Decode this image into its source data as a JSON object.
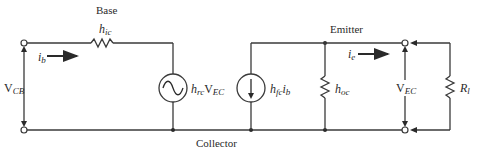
{
  "diagram": {
    "node_labels": {
      "base": "Base",
      "emitter": "Emitter",
      "collector": "Collector"
    },
    "components": {
      "input_resistor": {
        "symbol": "h",
        "subscript": "ic"
      },
      "voltage_source": {
        "symbol": "h",
        "subscript": "rc",
        "times": "V",
        "times_subscript": "EC"
      },
      "current_source": {
        "symbol": "h",
        "subscript": "fc",
        "times": "i",
        "times_subscript": "b"
      },
      "output_conductance": {
        "symbol": "h",
        "subscript": "oc"
      },
      "load_resistor": {
        "symbol": "R",
        "subscript": "l"
      }
    },
    "currents": {
      "input": {
        "symbol": "i",
        "subscript": "b"
      },
      "output": {
        "symbol": "i",
        "subscript": "e"
      }
    },
    "voltages": {
      "input": {
        "symbol": "V",
        "subscript": "CB"
      },
      "output": {
        "symbol": "V",
        "subscript": "EC"
      }
    }
  }
}
